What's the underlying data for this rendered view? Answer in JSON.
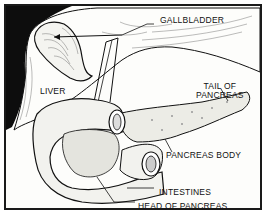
{
  "diagram": {
    "labels": {
      "gallbladder": "GALLBLADDER",
      "liver": "LIVER",
      "tail_line1": "TAIL OF",
      "tail_line2": "PANCREAS",
      "body": "PANCREAS BODY",
      "intestines": "INTESTINES",
      "head": "HEAD OF PANCREAS"
    },
    "colors": {
      "ink": "#111111",
      "paper": "#fdfdfb",
      "shadow": "#0d0d0d"
    }
  }
}
